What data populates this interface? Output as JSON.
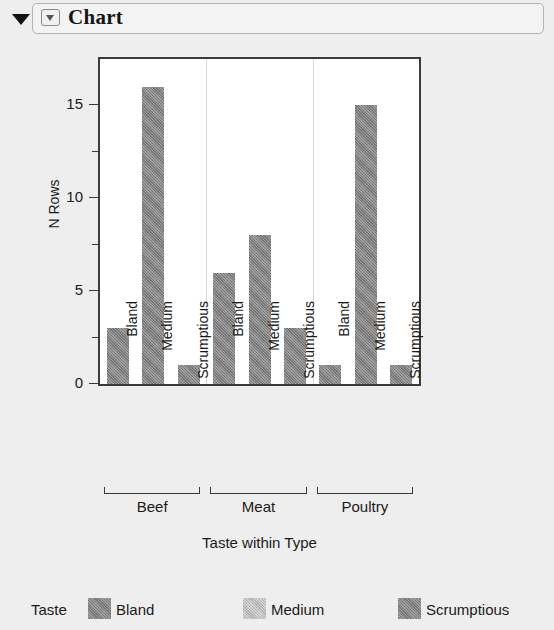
{
  "header": {
    "title": "Chart",
    "disclosure_icon": "triangle-down-icon",
    "menu_icon": "chart-menu-triangle-icon"
  },
  "chart_data": {
    "type": "bar",
    "title": "",
    "xlabel": "Taste within Type",
    "ylabel": "N Rows",
    "ylim": [
      0,
      17.5
    ],
    "yticks": [
      0,
      5,
      10,
      15
    ],
    "yminorticks": [
      2.5,
      7.5,
      12.5
    ],
    "grid": false,
    "groups": [
      "Beef",
      "Meat",
      "Poultry"
    ],
    "categories": [
      "Bland",
      "Medium",
      "Scrumptious"
    ],
    "legend_title": "Taste",
    "legend_position": "bottom",
    "bars": [
      {
        "group": "Beef",
        "category": "Bland",
        "value": 3
      },
      {
        "group": "Beef",
        "category": "Medium",
        "value": 16
      },
      {
        "group": "Beef",
        "category": "Scrumptious",
        "value": 1
      },
      {
        "group": "Meat",
        "category": "Bland",
        "value": 6
      },
      {
        "group": "Meat",
        "category": "Medium",
        "value": 8
      },
      {
        "group": "Meat",
        "category": "Scrumptious",
        "value": 3
      },
      {
        "group": "Poultry",
        "category": "Bland",
        "value": 1
      },
      {
        "group": "Poultry",
        "category": "Medium",
        "value": 15
      },
      {
        "group": "Poultry",
        "category": "Scrumptious",
        "value": 1
      }
    ],
    "series": [
      {
        "name": "Bland",
        "values": [
          3,
          6,
          1
        ],
        "color": "#7d7d7d"
      },
      {
        "name": "Medium",
        "values": [
          16,
          8,
          15
        ],
        "color": "#b9b9b9"
      },
      {
        "name": "Scrumptious",
        "values": [
          1,
          3,
          1
        ],
        "color": "#7d7d7d"
      }
    ],
    "legend": [
      {
        "label": "Bland",
        "swatch": "dark"
      },
      {
        "label": "Medium",
        "swatch": "light"
      },
      {
        "label": "Scrumptious",
        "swatch": "dark"
      }
    ],
    "bar_color": "#7d7d7d",
    "frame_color": "#3b3b3b",
    "plot_background": "#ffffff"
  }
}
